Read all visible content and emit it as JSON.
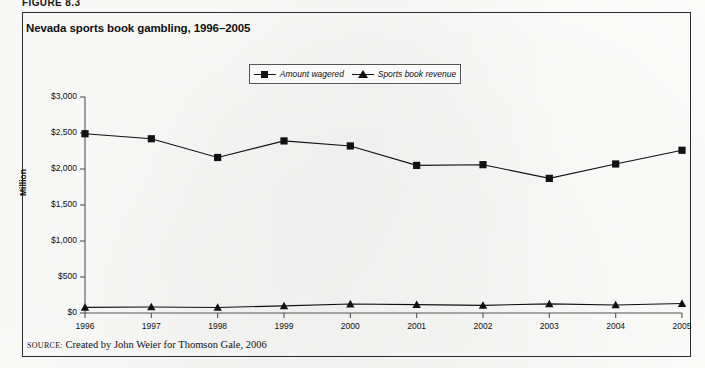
{
  "figure": {
    "caption": "FIGURE 8.3",
    "title": "Nevada sports book gambling, 1996–2005",
    "source_keyword": "SOURCE:",
    "source_text": " Created by John Weier for Thomson Gale, 2006"
  },
  "legend": {
    "position": "top-center",
    "entries": [
      {
        "label": "Amount wagered",
        "marker": "square-marker-icon",
        "color": "#111111"
      },
      {
        "label": "Sports book revenue",
        "marker": "triangle-marker-icon",
        "color": "#111111"
      }
    ]
  },
  "axes": {
    "y_label": "Million",
    "y_ticks": [
      "$0",
      "$500",
      "$1,000",
      "$1,500",
      "$2,000",
      "$2,500",
      "$3,000"
    ],
    "x_ticks": [
      "1996",
      "1997",
      "1998",
      "1999",
      "2000",
      "2001",
      "2002",
      "2003",
      "2004",
      "2005"
    ]
  },
  "chart_data": {
    "type": "line",
    "title": "Nevada sports book gambling, 1996–2005",
    "xlabel": "",
    "ylabel": "Million",
    "ylim": [
      0,
      3000
    ],
    "ytick_values": [
      0,
      500,
      1000,
      1500,
      2000,
      2500,
      3000
    ],
    "ytick_labels": [
      "$0",
      "$500",
      "$1,000",
      "$1,500",
      "$2,000",
      "$2,500",
      "$3,000"
    ],
    "grid": false,
    "legend_position": "top-center",
    "categories": [
      "1996",
      "1997",
      "1998",
      "1999",
      "2000",
      "2001",
      "2002",
      "2003",
      "2004",
      "2005"
    ],
    "series": [
      {
        "name": "Amount wagered",
        "marker": "square",
        "color": "#111111",
        "values": [
          2490,
          2420,
          2160,
          2390,
          2320,
          2050,
          2060,
          1870,
          2070,
          2260
        ]
      },
      {
        "name": "Sports book revenue",
        "marker": "triangle",
        "color": "#111111",
        "values": [
          78,
          84,
          77,
          99,
          124,
          117,
          106,
          127,
          112,
          131
        ]
      }
    ],
    "source": "Created by John Weier for Thomson Gale, 2006"
  }
}
